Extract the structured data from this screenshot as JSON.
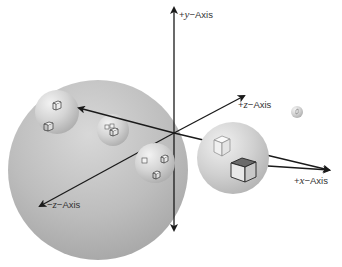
{
  "diagram": {
    "type": "3d-coordinate-system-with-nested-spheres",
    "axes": {
      "y_pos": {
        "sign": "+",
        "var": "y",
        "suffix": "−Axis"
      },
      "z_pos": {
        "sign": "+",
        "var": "z",
        "suffix": "−Axis"
      },
      "x_pos": {
        "sign": "+",
        "var": "x",
        "suffix": "−Axis"
      },
      "z_neg": {
        "sign": "−",
        "var": "z",
        "suffix": "−Axis"
      }
    },
    "spheres": [
      {
        "id": "large-sphere",
        "cx": 98,
        "cy": 170,
        "r": 90
      },
      {
        "id": "right-sphere",
        "cx": 233,
        "cy": 158,
        "r": 36
      },
      {
        "id": "inner-sphere-1",
        "cx": 57,
        "cy": 112,
        "r": 22
      },
      {
        "id": "inner-sphere-2",
        "cx": 113,
        "cy": 130,
        "r": 16
      },
      {
        "id": "inner-sphere-3",
        "cx": 155,
        "cy": 163,
        "r": 20
      },
      {
        "id": "tiny-sphere",
        "cx": 297,
        "cy": 112,
        "r": 6
      }
    ],
    "colors": {
      "sphere_fill": "#b8b8b8",
      "axis": "#1a1a1a",
      "background": "#ffffff"
    }
  }
}
